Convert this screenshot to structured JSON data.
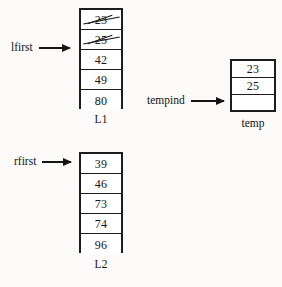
{
  "diagram": {
    "background_color": "#fbfaf8",
    "ink_color": "#141414"
  },
  "structures": [
    {
      "id": "l1",
      "caption": "L1",
      "cells": [
        {
          "value": "23",
          "struck": true,
          "empty": false
        },
        {
          "value": "25",
          "struck": true,
          "empty": false
        },
        {
          "value": "42",
          "struck": false,
          "empty": false
        },
        {
          "value": "49",
          "struck": false,
          "empty": false
        },
        {
          "value": "80",
          "struck": false,
          "empty": false
        }
      ]
    },
    {
      "id": "l2",
      "caption": "L2",
      "cells": [
        {
          "value": "39",
          "struck": false,
          "empty": false
        },
        {
          "value": "46",
          "struck": false,
          "empty": false
        },
        {
          "value": "73",
          "struck": false,
          "empty": false
        },
        {
          "value": "74",
          "struck": false,
          "empty": false
        },
        {
          "value": "96",
          "struck": false,
          "empty": false
        }
      ]
    },
    {
      "id": "temp",
      "caption": "temp",
      "cells": [
        {
          "value": "23",
          "struck": false,
          "empty": false
        },
        {
          "value": "25",
          "struck": false,
          "empty": false
        },
        {
          "value": "",
          "struck": false,
          "empty": true
        }
      ]
    }
  ],
  "pointers": [
    {
      "id": "lfirst",
      "label": "lfirst",
      "target": "l1",
      "target_cell_index": 2
    },
    {
      "id": "rfirst",
      "label": "rfirst",
      "target": "l2",
      "target_cell_index": 0
    },
    {
      "id": "tempind",
      "label": "tempind",
      "target": "temp",
      "target_cell_index": 2
    }
  ]
}
